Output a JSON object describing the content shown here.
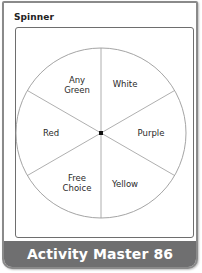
{
  "title": "Spinner",
  "spinner": {
    "segments": [
      {
        "label_line1": "Any",
        "label_line2": "Green"
      },
      {
        "label_line1": "White"
      },
      {
        "label_line1": "Purple"
      },
      {
        "label_line1": "Yellow"
      },
      {
        "label_line1": "Free",
        "label_line2": "Choice"
      },
      {
        "label_line1": "Red"
      }
    ],
    "line_color": "#9a9a9a",
    "center_color": "#111111"
  },
  "footer": {
    "label": "Activity Master 86",
    "background": "#6f6f70"
  }
}
